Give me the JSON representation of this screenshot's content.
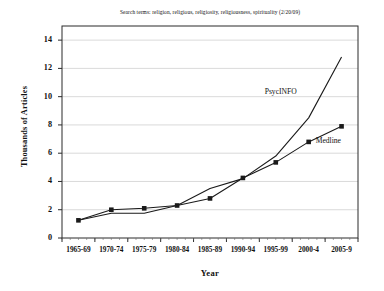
{
  "chart_data": {
    "type": "line",
    "title": "Search terms: religion, religious, religiosity, religiousness, spirituality  (2/20/09)",
    "xlabel": "Year",
    "ylabel": "Thousands of Articles",
    "categories": [
      "1965-69",
      "1970-74",
      "1975-79",
      "1980-84",
      "1985-89",
      "1990-94",
      "1995-99",
      "2000-4",
      "2005-9"
    ],
    "ylim": [
      0,
      15
    ],
    "yticks": [
      "0",
      "2",
      "4",
      "6",
      "8",
      "10",
      "12",
      "14"
    ],
    "ytick_values": [
      0,
      2,
      4,
      6,
      8,
      10,
      12,
      14
    ],
    "grid": true,
    "legend_position": "inline-annotations",
    "series": [
      {
        "name": "PsycINFO",
        "values": [
          1.25,
          1.75,
          1.75,
          2.3,
          3.5,
          4.2,
          5.8,
          8.5,
          12.8
        ],
        "marker": "none",
        "color": "#1a1a1a"
      },
      {
        "name": "Medline",
        "values": [
          1.25,
          2.0,
          2.1,
          2.3,
          2.8,
          4.25,
          5.35,
          6.8,
          7.9
        ],
        "marker": "square",
        "color": "#1a1a1a"
      }
    ],
    "annotations": [
      {
        "text": "PsycINFO",
        "series": "PsycINFO"
      },
      {
        "text": "Medline",
        "series": "Medline"
      }
    ]
  },
  "axis": {
    "y_title": "Thousands of Articles",
    "x_title": "Year"
  }
}
